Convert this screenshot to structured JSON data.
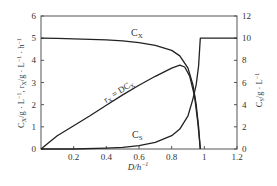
{
  "chart_data": {
    "type": "line",
    "title": "",
    "xlabel": "D/h⁻¹",
    "ylabel_left": "C_X/g·L⁻¹, r_X/g·L⁻¹·h⁻¹",
    "ylabel_right": "C_S/g·L⁻¹",
    "xlim": [
      0,
      1.2
    ],
    "ylim_left": [
      0,
      6
    ],
    "ylim_right": [
      0,
      12
    ],
    "x_ticks": [
      "0.2",
      "0.4",
      "0.6",
      "0.8",
      "1",
      "1.2"
    ],
    "y_ticks_left": [
      "0",
      "1",
      "2",
      "3",
      "4",
      "5",
      "6"
    ],
    "y_ticks_right": [
      "0",
      "2",
      "4",
      "6",
      "8",
      "10",
      "12"
    ],
    "grid": false,
    "legend": "inline labels",
    "series": [
      {
        "name": "C_X",
        "axis": "left",
        "label": "C_X",
        "points": [
          [
            0,
            5.0
          ],
          [
            0.1,
            4.99
          ],
          [
            0.2,
            4.97
          ],
          [
            0.3,
            4.95
          ],
          [
            0.4,
            4.92
          ],
          [
            0.5,
            4.88
          ],
          [
            0.6,
            4.8
          ],
          [
            0.7,
            4.68
          ],
          [
            0.8,
            4.45
          ],
          [
            0.85,
            4.2
          ],
          [
            0.9,
            3.65
          ],
          [
            0.93,
            2.9
          ],
          [
            0.95,
            2.0
          ],
          [
            0.965,
            1.0
          ],
          [
            0.975,
            0.0
          ]
        ]
      },
      {
        "name": "r_X",
        "axis": "left",
        "label": "r_X = DC_X",
        "points": [
          [
            0,
            0
          ],
          [
            0.05,
            0.3
          ],
          [
            0.1,
            0.6
          ],
          [
            0.2,
            1.05
          ],
          [
            0.3,
            1.5
          ],
          [
            0.4,
            1.97
          ],
          [
            0.5,
            2.44
          ],
          [
            0.6,
            2.88
          ],
          [
            0.7,
            3.28
          ],
          [
            0.8,
            3.65
          ],
          [
            0.85,
            3.78
          ],
          [
            0.88,
            3.7
          ],
          [
            0.91,
            3.3
          ],
          [
            0.94,
            2.4
          ],
          [
            0.96,
            1.2
          ],
          [
            0.975,
            0.0
          ]
        ]
      },
      {
        "name": "C_S",
        "axis": "right",
        "label": "C_S",
        "points": [
          [
            0,
            0
          ],
          [
            0.2,
            0.0
          ],
          [
            0.4,
            0.08
          ],
          [
            0.5,
            0.15
          ],
          [
            0.6,
            0.3
          ],
          [
            0.7,
            0.6
          ],
          [
            0.8,
            1.2
          ],
          [
            0.85,
            1.8
          ],
          [
            0.9,
            3.0
          ],
          [
            0.93,
            4.5
          ],
          [
            0.95,
            5.8
          ],
          [
            0.965,
            7.5
          ],
          [
            0.975,
            10.0
          ],
          [
            1.2,
            10.0
          ]
        ]
      }
    ]
  }
}
